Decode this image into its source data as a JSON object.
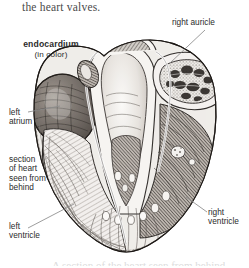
{
  "page": {
    "body_caption": "the heart valves.",
    "bottom_bleed_text": "A section of the heart seen from behind",
    "background_color": "#ffffff",
    "ink_color": "#2b2b2b"
  },
  "figure": {
    "subject": "section of heart seen from behind",
    "style": "engraving",
    "labels": [
      {
        "id": "endocardium",
        "title": "endocardium",
        "subtitle": "(in color)",
        "bold": true,
        "has_leader": false
      },
      {
        "id": "right-auricle",
        "title": "right auricle",
        "bold": false,
        "has_leader": true
      },
      {
        "id": "left-atrium",
        "title": "left\natrium",
        "bold": false,
        "has_leader": true
      },
      {
        "id": "section-of-heart",
        "title": "section\nof heart\nseen from\nbehind",
        "bold": false,
        "has_leader": false
      },
      {
        "id": "left-ventricle",
        "title": "left\nventricle",
        "bold": false,
        "has_leader": true
      },
      {
        "id": "right-ventricle",
        "title": "right\nventricle",
        "bold": false,
        "has_leader": true
      }
    ],
    "leader_color": "#8b8b8b"
  }
}
